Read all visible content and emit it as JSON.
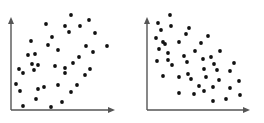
{
  "colors": {
    "axis": "#555555",
    "point": "#111111",
    "background": "#ffffff"
  },
  "chart_data": [
    {
      "type": "scatter",
      "title": "",
      "xlabel": "",
      "ylabel": "",
      "grid": false,
      "legend": null,
      "description": "Positive correlation (weak)",
      "frame": {
        "x0": 11,
        "y0": 110,
        "x1": 114,
        "y1": 18
      },
      "points_px": [
        [
          71,
          15
        ],
        [
          46,
          24
        ],
        [
          89,
          20
        ],
        [
          65,
          26
        ],
        [
          80,
          26
        ],
        [
          69,
          32
        ],
        [
          95,
          33
        ],
        [
          52,
          37
        ],
        [
          31,
          41
        ],
        [
          48,
          45
        ],
        [
          86,
          46
        ],
        [
          107,
          46
        ],
        [
          58,
          50
        ],
        [
          28,
          55
        ],
        [
          35,
          54
        ],
        [
          93,
          52
        ],
        [
          79,
          57
        ],
        [
          32,
          64
        ],
        [
          38,
          65
        ],
        [
          73,
          63
        ],
        [
          55,
          66
        ],
        [
          65,
          68
        ],
        [
          19,
          69
        ],
        [
          34,
          70
        ],
        [
          90,
          69
        ],
        [
          23,
          73
        ],
        [
          65,
          73
        ],
        [
          85,
          75
        ],
        [
          16,
          84
        ],
        [
          58,
          85
        ],
        [
          77,
          85
        ],
        [
          44,
          87
        ],
        [
          38,
          89
        ],
        [
          20,
          91
        ],
        [
          71,
          92
        ],
        [
          36,
          99
        ],
        [
          62,
          102
        ],
        [
          23,
          106
        ],
        [
          51,
          107
        ]
      ]
    },
    {
      "type": "scatter",
      "title": "",
      "xlabel": "",
      "ylabel": "",
      "grid": false,
      "legend": null,
      "description": "Negative correlation",
      "frame": {
        "x0": 147,
        "y0": 110,
        "x1": 249,
        "y1": 18
      },
      "points_px": [
        [
          170,
          15
        ],
        [
          158,
          23
        ],
        [
          171,
          26
        ],
        [
          189,
          28
        ],
        [
          161,
          30
        ],
        [
          186,
          34
        ],
        [
          156,
          38
        ],
        [
          208,
          36
        ],
        [
          163,
          42
        ],
        [
          165,
          44
        ],
        [
          179,
          42
        ],
        [
          201,
          43
        ],
        [
          159,
          49
        ],
        [
          195,
          51
        ],
        [
          220,
          51
        ],
        [
          168,
          53
        ],
        [
          184,
          56
        ],
        [
          211,
          57
        ],
        [
          203,
          59
        ],
        [
          168,
          60
        ],
        [
          157,
          61
        ],
        [
          187,
          62
        ],
        [
          214,
          64
        ],
        [
          234,
          63
        ],
        [
          172,
          65
        ],
        [
          204,
          69
        ],
        [
          217,
          70
        ],
        [
          230,
          71
        ],
        [
          188,
          74
        ],
        [
          163,
          76
        ],
        [
          179,
          77
        ],
        [
          206,
          77
        ],
        [
          191,
          79
        ],
        [
          219,
          80
        ],
        [
          239,
          81
        ],
        [
          199,
          86
        ],
        [
          213,
          87
        ],
        [
          204,
          91
        ],
        [
          230,
          88
        ],
        [
          179,
          93
        ],
        [
          194,
          94
        ],
        [
          240,
          95
        ],
        [
          213,
          101
        ],
        [
          226,
          99
        ]
      ]
    }
  ]
}
